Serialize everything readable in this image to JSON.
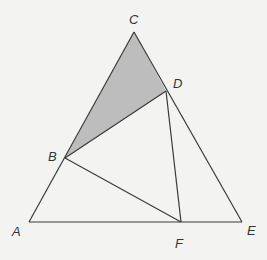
{
  "diagram": {
    "type": "geometry",
    "colors": {
      "background": "#f3f3f1",
      "stroke": "#3a3a3a",
      "shade": "#bdbdbd"
    },
    "points": {
      "A": {
        "label": "A",
        "x": 29,
        "y": 222,
        "lx": 12,
        "ly": 225
      },
      "B": {
        "label": "B",
        "x": 65,
        "y": 158,
        "lx": 48,
        "ly": 150
      },
      "C": {
        "label": "C",
        "x": 134,
        "y": 32,
        "lx": 129,
        "ly": 13
      },
      "D": {
        "label": "D",
        "x": 166,
        "y": 91,
        "lx": 173,
        "ly": 77
      },
      "E": {
        "label": "E",
        "x": 242,
        "y": 222,
        "lx": 247,
        "ly": 224
      },
      "F": {
        "label": "F",
        "x": 181,
        "y": 222,
        "lx": 175,
        "ly": 237
      }
    },
    "segments": [
      [
        "A",
        "C"
      ],
      [
        "C",
        "E"
      ],
      [
        "A",
        "E"
      ],
      [
        "B",
        "D"
      ],
      [
        "B",
        "F"
      ],
      [
        "D",
        "F"
      ]
    ],
    "shaded_region": [
      "B",
      "C",
      "D"
    ]
  }
}
